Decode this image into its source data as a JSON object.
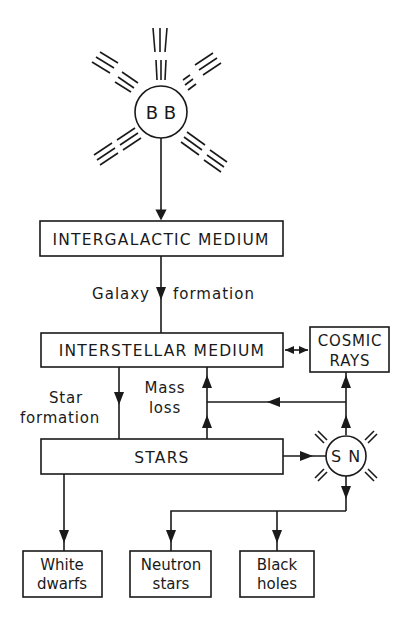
{
  "diagram": {
    "nodes": {
      "big_bang": {
        "label": "B B"
      },
      "intergalactic": {
        "label": "INTERGALACTIC MEDIUM"
      },
      "interstellar": {
        "label": "INTERSTELLAR MEDIUM"
      },
      "cosmic_rays": {
        "line1": "COSMIC",
        "line2": "RAYS"
      },
      "stars": {
        "label": "STARS"
      },
      "supernova": {
        "label": "S N"
      },
      "white_dwarfs": {
        "line1": "White",
        "line2": "dwarfs"
      },
      "neutron_stars": {
        "line1": "Neutron",
        "line2": "stars"
      },
      "black_holes": {
        "line1": "Black",
        "line2": "holes"
      }
    },
    "edge_labels": {
      "galaxy": "Galaxy",
      "formation": "formation",
      "star": "Star",
      "star_formation": "formation",
      "mass": "Mass",
      "loss": "loss"
    },
    "colors": {
      "ink": "#1a1a1a",
      "background": "#ffffff"
    }
  }
}
